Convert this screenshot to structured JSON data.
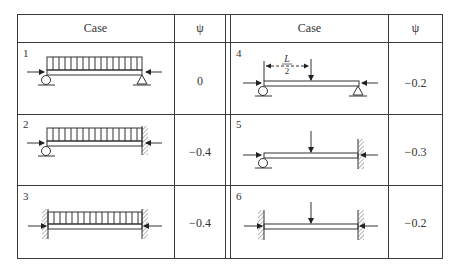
{
  "table": {
    "headers": {
      "left_case": "Case",
      "left_psi": "ψ",
      "right_case": "Case",
      "right_psi": "ψ"
    },
    "rows": [
      {
        "case": "1",
        "psi": "0",
        "description": "simply supported, uniform load, axial compression"
      },
      {
        "case": "2",
        "psi": "−0.4",
        "description": "pinned-fixed, uniform load, axial compression"
      },
      {
        "case": "3",
        "psi": "−0.4",
        "description": "fixed-fixed, uniform load, axial compression"
      },
      {
        "case": "4",
        "psi": "−0.2",
        "description": "simply supported, midspan point load, axial compression"
      },
      {
        "case": "5",
        "psi": "−0.3",
        "description": "pinned-fixed, midspan point load, axial compression"
      },
      {
        "case": "6",
        "psi": "−0.2",
        "description": "fixed-fixed, midspan point load, axial compression"
      }
    ],
    "dimension_label_top": "L",
    "dimension_label_bottom": "2"
  }
}
